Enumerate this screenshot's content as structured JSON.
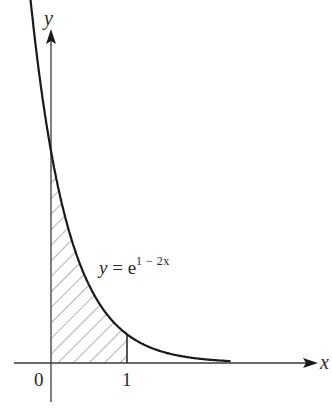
{
  "figure": {
    "x_axis_label": "x",
    "y_axis_label": "y",
    "origin_label": "0",
    "tick_label_1": "1",
    "equation": {
      "lhs": "y",
      "equals": " = ",
      "base": "e",
      "exponent": "1 − 2x"
    },
    "colors": {
      "curve": "#1a1a1a",
      "axes": "#3a3a3a",
      "hatch": "#555555",
      "background": "#ffffff"
    }
  },
  "chart_data": {
    "type": "line",
    "title": "",
    "function": "y = e^(1 - 2x)",
    "xlabel": "x",
    "ylabel": "y",
    "x_ticks": [
      "0",
      "1"
    ],
    "shaded_region": {
      "from_x": 0,
      "to_x": 1,
      "pattern": "diagonal-hatch",
      "bounded_by": "curve, x-axis, x=0, x=1"
    },
    "series": [
      {
        "name": "y = e^(1-2x)",
        "x": [
          -0.28,
          -0.2,
          -0.1,
          0,
          0.1,
          0.2,
          0.3,
          0.4,
          0.5,
          0.6,
          0.7,
          0.8,
          0.9,
          1.0,
          1.2,
          1.4,
          1.6,
          1.8,
          2.0,
          2.3
        ],
        "y": [
          4.75,
          4.06,
          3.32,
          2.72,
          2.23,
          1.82,
          1.49,
          1.22,
          1.0,
          0.82,
          0.67,
          0.55,
          0.45,
          0.37,
          0.25,
          0.17,
          0.11,
          0.07,
          0.05,
          0.03
        ]
      }
    ],
    "grid": false,
    "legend": "none"
  }
}
